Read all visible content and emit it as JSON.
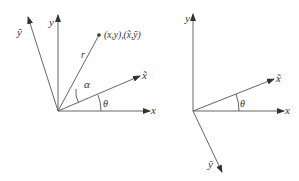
{
  "left_diagram": {
    "labels": {
      "x": "x",
      "y": "y",
      "x_tilde": "x̃",
      "y_tilde": "ỹ",
      "r": "r",
      "alpha": "α",
      "theta": "θ",
      "point": "(x,y),(x̃,ỹ)"
    }
  },
  "right_diagram": {
    "labels": {
      "x": "x",
      "y": "y",
      "x_tilde": "x̃",
      "y_tilde": "ỹ",
      "theta": "θ"
    }
  },
  "colors": {
    "line": "#555555",
    "text": "#333333",
    "background": "#ffffff"
  }
}
